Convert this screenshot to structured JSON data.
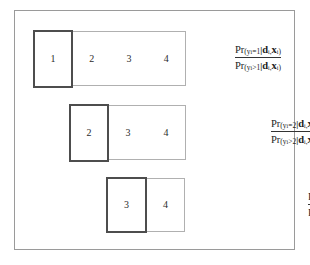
{
  "figure": {
    "frame_color": "#9a9a9a",
    "background": "#ffffff",
    "current_box_color": "#4d4d4d",
    "remaining_box_color": "#b0b0b0"
  },
  "rows": [
    {
      "current_category": "1",
      "remaining_categories": [
        "2",
        "3",
        "4"
      ],
      "formula": {
        "numerator": {
          "pr": "Pr",
          "open": "(",
          "variable": "y",
          "var_sub": "i",
          "relation": "=1",
          "given": "|",
          "cond1": "d",
          "cond1_sub": "i",
          "comma": ",",
          "cond2": "x",
          "cond2_sub": "i",
          "close": ")"
        },
        "denominator": {
          "pr": "Pr",
          "open": "(",
          "variable": "y",
          "var_sub": "i",
          "relation": ">1",
          "given": "|",
          "cond1": "d",
          "cond1_sub": "i",
          "comma": ",",
          "cond2": "x",
          "cond2_sub": "i",
          "close": ")"
        }
      }
    },
    {
      "current_category": "2",
      "remaining_categories": [
        "3",
        "4"
      ],
      "formula": {
        "numerator": {
          "pr": "Pr",
          "open": "(",
          "variable": "y",
          "var_sub": "i",
          "relation": "=2",
          "given": "|",
          "cond1": "d",
          "cond1_sub": "i",
          "comma": ",",
          "cond2": "x",
          "cond2_sub": "i",
          "close": ")"
        },
        "denominator": {
          "pr": "Pr",
          "open": "(",
          "variable": "y",
          "var_sub": "i",
          "relation": ">2",
          "given": "|",
          "cond1": "d",
          "cond1_sub": "i",
          "comma": ",",
          "cond2": "x",
          "cond2_sub": "i",
          "close": ")"
        }
      }
    },
    {
      "current_category": "3",
      "remaining_categories": [
        "4"
      ],
      "formula": {
        "numerator": {
          "pr": "Pr",
          "open": "(",
          "variable": "y",
          "var_sub": "i",
          "relation": "=3",
          "given": "|",
          "cond1": "d",
          "cond1_sub": "i",
          "comma": ",",
          "cond2": "x",
          "cond2_sub": "i",
          "close": ")"
        },
        "denominator": {
          "pr": "Pr",
          "open": "(",
          "variable": "y",
          "var_sub": "i",
          "relation": ">3",
          "given": "|",
          "cond1": "d",
          "cond1_sub": "i",
          "comma": ",",
          "cond2": "x",
          "cond2_sub": "i",
          "close": ")"
        }
      }
    }
  ]
}
